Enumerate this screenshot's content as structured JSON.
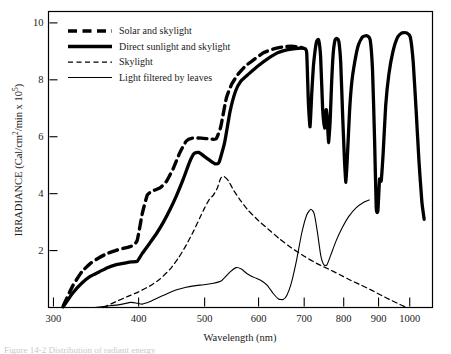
{
  "figure": {
    "caption_partial": "Figure 14-2  Distribution of radiant energy"
  },
  "chart_data": {
    "type": "line",
    "title": "",
    "xlabel": "Wavelength (nm)",
    "ylabel": "IRRADIANCE (Cal/cm²/min x 10⁵)",
    "ylabel_parts": {
      "main": "IRRADIANCE (Cal/cm",
      "sup1": "2",
      "mid": "/min x 10",
      "sup2": "5",
      "close": ")"
    },
    "x_scale": "log",
    "xlim": [
      295,
      1080
    ],
    "ylim": [
      0,
      10.4
    ],
    "grid": false,
    "legend_position": "top-left",
    "xticks": [
      300,
      400,
      500,
      600,
      700,
      800,
      900,
      1000
    ],
    "xtick_labels": [
      "300",
      "400",
      "500",
      "600",
      "700",
      "800",
      "900",
      "1000"
    ],
    "yticks": [
      2,
      4,
      6,
      8,
      10
    ],
    "ytick_labels": [
      "2",
      "4",
      "6",
      "8",
      "10"
    ],
    "series": [
      {
        "name": "Solar and skylight",
        "style": "thick-dashed",
        "points": [
          [
            310,
            0.05
          ],
          [
            320,
            0.75
          ],
          [
            330,
            1.25
          ],
          [
            340,
            1.55
          ],
          [
            350,
            1.75
          ],
          [
            360,
            1.9
          ],
          [
            370,
            2.0
          ],
          [
            380,
            2.08
          ],
          [
            390,
            2.15
          ],
          [
            398,
            2.35
          ],
          [
            405,
            3.3
          ],
          [
            412,
            3.95
          ],
          [
            420,
            4.1
          ],
          [
            430,
            4.2
          ],
          [
            440,
            4.45
          ],
          [
            450,
            4.9
          ],
          [
            460,
            5.45
          ],
          [
            470,
            5.85
          ],
          [
            480,
            5.95
          ],
          [
            495,
            5.95
          ],
          [
            510,
            5.92
          ],
          [
            520,
            5.93
          ],
          [
            528,
            6.35
          ],
          [
            538,
            7.35
          ],
          [
            548,
            7.85
          ],
          [
            560,
            8.2
          ],
          [
            575,
            8.5
          ],
          [
            590,
            8.7
          ],
          [
            610,
            8.95
          ],
          [
            630,
            9.08
          ],
          [
            650,
            9.15
          ],
          [
            670,
            9.18
          ],
          [
            690,
            9.15
          ],
          [
            700,
            9.1
          ]
        ]
      },
      {
        "name": "Direct sunlight and skylight",
        "style": "thick-solid",
        "points": [
          [
            310,
            0.02
          ],
          [
            320,
            0.5
          ],
          [
            330,
            0.85
          ],
          [
            340,
            1.1
          ],
          [
            350,
            1.25
          ],
          [
            360,
            1.4
          ],
          [
            370,
            1.5
          ],
          [
            380,
            1.55
          ],
          [
            390,
            1.6
          ],
          [
            398,
            1.62
          ],
          [
            405,
            1.9
          ],
          [
            415,
            2.25
          ],
          [
            425,
            2.6
          ],
          [
            435,
            3.0
          ],
          [
            445,
            3.45
          ],
          [
            455,
            3.95
          ],
          [
            465,
            4.5
          ],
          [
            475,
            5.1
          ],
          [
            482,
            5.4
          ],
          [
            490,
            5.45
          ],
          [
            500,
            5.3
          ],
          [
            510,
            5.15
          ],
          [
            518,
            5.05
          ],
          [
            525,
            5.1
          ],
          [
            535,
            5.8
          ],
          [
            545,
            6.9
          ],
          [
            555,
            7.6
          ],
          [
            565,
            7.95
          ],
          [
            580,
            8.2
          ],
          [
            600,
            8.5
          ],
          [
            620,
            8.75
          ],
          [
            640,
            8.95
          ],
          [
            660,
            9.05
          ],
          [
            680,
            9.1
          ],
          [
            700,
            9.1
          ],
          [
            706,
            8.95
          ],
          [
            710,
            7.2
          ],
          [
            714,
            6.35
          ],
          [
            718,
            7.5
          ],
          [
            722,
            8.45
          ],
          [
            726,
            9.0
          ],
          [
            730,
            9.35
          ],
          [
            735,
            9.4
          ],
          [
            740,
            8.8
          ],
          [
            745,
            7.0
          ],
          [
            750,
            6.3
          ],
          [
            754,
            6.95
          ],
          [
            757,
            6.6
          ],
          [
            760,
            5.8
          ],
          [
            764,
            6.5
          ],
          [
            768,
            7.9
          ],
          [
            772,
            8.9
          ],
          [
            777,
            9.4
          ],
          [
            782,
            9.45
          ],
          [
            787,
            9.35
          ],
          [
            792,
            8.6
          ],
          [
            797,
            6.8
          ],
          [
            802,
            5.2
          ],
          [
            806,
            4.4
          ],
          [
            810,
            5.3
          ],
          [
            816,
            6.9
          ],
          [
            822,
            7.9
          ],
          [
            830,
            8.6
          ],
          [
            840,
            9.2
          ],
          [
            852,
            9.5
          ],
          [
            865,
            9.55
          ],
          [
            875,
            9.4
          ],
          [
            882,
            8.3
          ],
          [
            888,
            5.9
          ],
          [
            893,
            3.5
          ],
          [
            898,
            3.4
          ],
          [
            903,
            4.5
          ],
          [
            908,
            4.45
          ],
          [
            914,
            5.4
          ],
          [
            922,
            7.1
          ],
          [
            932,
            8.2
          ],
          [
            945,
            9.0
          ],
          [
            960,
            9.5
          ],
          [
            975,
            9.65
          ],
          [
            990,
            9.65
          ],
          [
            1002,
            9.5
          ],
          [
            1012,
            8.6
          ],
          [
            1022,
            6.9
          ],
          [
            1032,
            5.1
          ],
          [
            1042,
            3.7
          ],
          [
            1050,
            3.1
          ]
        ]
      },
      {
        "name": "Skylight",
        "style": "thin-dashed",
        "points": [
          [
            355,
            0.0
          ],
          [
            370,
            0.2
          ],
          [
            385,
            0.38
          ],
          [
            400,
            0.55
          ],
          [
            415,
            0.75
          ],
          [
            430,
            1.0
          ],
          [
            445,
            1.35
          ],
          [
            458,
            1.75
          ],
          [
            470,
            2.2
          ],
          [
            482,
            2.7
          ],
          [
            492,
            3.15
          ],
          [
            500,
            3.5
          ],
          [
            508,
            3.8
          ],
          [
            515,
            3.95
          ],
          [
            522,
            4.2
          ],
          [
            528,
            4.55
          ],
          [
            534,
            4.6
          ],
          [
            542,
            4.45
          ],
          [
            552,
            4.1
          ],
          [
            565,
            3.75
          ],
          [
            580,
            3.4
          ],
          [
            600,
            3.05
          ],
          [
            620,
            2.75
          ],
          [
            645,
            2.4
          ],
          [
            670,
            2.1
          ],
          [
            700,
            1.8
          ],
          [
            730,
            1.55
          ],
          [
            760,
            1.35
          ],
          [
            790,
            1.15
          ],
          [
            820,
            0.95
          ],
          [
            850,
            0.78
          ],
          [
            880,
            0.6
          ],
          [
            910,
            0.42
          ],
          [
            940,
            0.25
          ],
          [
            965,
            0.12
          ],
          [
            985,
            0.02
          ]
        ]
      },
      {
        "name": "Light filtered by leaves",
        "style": "thin-solid",
        "points": [
          [
            345,
            0.0
          ],
          [
            360,
            0.05
          ],
          [
            375,
            0.1
          ],
          [
            390,
            0.18
          ],
          [
            398,
            0.15
          ],
          [
            405,
            0.12
          ],
          [
            415,
            0.2
          ],
          [
            428,
            0.35
          ],
          [
            442,
            0.5
          ],
          [
            455,
            0.62
          ],
          [
            468,
            0.7
          ],
          [
            482,
            0.76
          ],
          [
            498,
            0.8
          ],
          [
            515,
            0.85
          ],
          [
            530,
            0.95
          ],
          [
            545,
            1.25
          ],
          [
            556,
            1.4
          ],
          [
            566,
            1.35
          ],
          [
            578,
            1.18
          ],
          [
            592,
            1.05
          ],
          [
            605,
            0.95
          ],
          [
            618,
            0.78
          ],
          [
            630,
            0.5
          ],
          [
            642,
            0.3
          ],
          [
            652,
            0.28
          ],
          [
            660,
            0.42
          ],
          [
            670,
            0.85
          ],
          [
            682,
            1.65
          ],
          [
            694,
            2.6
          ],
          [
            706,
            3.25
          ],
          [
            716,
            3.45
          ],
          [
            724,
            3.3
          ],
          [
            732,
            2.65
          ],
          [
            740,
            1.85
          ],
          [
            748,
            1.5
          ],
          [
            756,
            1.5
          ],
          [
            766,
            1.85
          ],
          [
            780,
            2.35
          ],
          [
            796,
            2.8
          ],
          [
            814,
            3.2
          ],
          [
            834,
            3.5
          ],
          [
            856,
            3.7
          ],
          [
            872,
            3.78
          ]
        ]
      }
    ],
    "legend_entries": [
      "Solar and skylight",
      "Direct sunlight and skylight",
      "Skylight",
      "Light filtered by leaves"
    ]
  }
}
